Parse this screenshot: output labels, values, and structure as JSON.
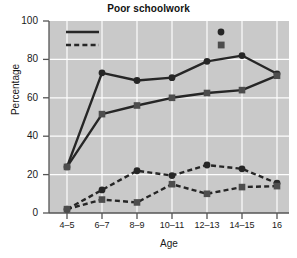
{
  "chart_data": {
    "type": "line",
    "title": "Poor schoolwork",
    "xlabel": "Age",
    "ylabel": "Percentage",
    "categories": [
      "4–5",
      "6–7",
      "8–9",
      "10–11",
      "12–13",
      "14–15",
      "16"
    ],
    "ylim": [
      0,
      100
    ],
    "yticks": [
      0,
      20,
      40,
      60,
      80,
      100
    ],
    "ytick_labels": [
      "0",
      "20",
      "40",
      "60",
      "80",
      "100"
    ],
    "grid": true,
    "legend_position": "top-inside",
    "series": [
      {
        "name": "Clinically referred — Boys",
        "group": "Clinically referred",
        "marker": "circle",
        "linestyle": "solid",
        "values": [
          24,
          73,
          69,
          70.5,
          79,
          82,
          72.5
        ]
      },
      {
        "name": "Clinically referred — Girls",
        "group": "Clinically referred",
        "marker": "square",
        "linestyle": "solid",
        "values": [
          24,
          51.5,
          56,
          60,
          62.5,
          64,
          71.5
        ]
      },
      {
        "name": "Nonreferred — Boys",
        "group": "Nonreferred",
        "marker": "circle",
        "linestyle": "dashed",
        "values": [
          2,
          12,
          22,
          19.5,
          25,
          23,
          15.5
        ]
      },
      {
        "name": "Nonreferred — Girls",
        "group": "Nonreferred",
        "marker": "square",
        "linestyle": "dashed",
        "values": [
          2,
          7,
          5.5,
          15,
          10,
          13.5,
          14
        ]
      }
    ],
    "legend": [
      {
        "label": "Clinically referred",
        "type": "line",
        "style": "solid"
      },
      {
        "label": "Nonreferred",
        "type": "line",
        "style": "dashed"
      },
      {
        "label": "Boys",
        "type": "marker",
        "style": "circle"
      },
      {
        "label": "Girls",
        "type": "marker",
        "style": "square"
      }
    ],
    "colors": {
      "series_line": "#262626",
      "plot_background": "#c9c9c9",
      "gridline": "#fdfdfd",
      "axis": "#4a4a4a",
      "text": "#1a1a1a"
    }
  }
}
